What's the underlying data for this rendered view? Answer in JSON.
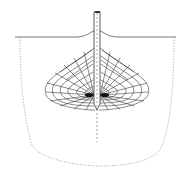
{
  "diagram": {
    "title": "",
    "colors": {
      "background": "#ffffff",
      "line": "#333333",
      "mesh": "#2a2a2a",
      "dotted": "#9a9a9a",
      "dense_core": "#111111"
    },
    "elements": {
      "ground_surface": {
        "y": 37,
        "x_start": 15,
        "x_end": 176
      },
      "rod": {
        "x": 97,
        "top_y": 11,
        "tip_y": 108,
        "width": 6
      },
      "center_axis": {
        "x": 97,
        "y_start": 11,
        "y_end": 142
      },
      "mesh_zone": {
        "top_y": 48,
        "bottom_y": 110,
        "left_x": 45,
        "right_x": 149,
        "rows": 8,
        "columns": 14
      },
      "dotted_boundary": {
        "left_x": 20,
        "right_x": 174,
        "top_y": 37,
        "bottom_y": 166
      }
    },
    "labels": []
  }
}
